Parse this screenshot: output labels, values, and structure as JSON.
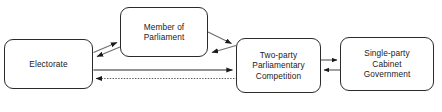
{
  "diagram": {
    "line_color": "#2b2b2b",
    "box_fill": "#ffffff",
    "nodes": [
      {
        "id": "electorate",
        "label": "Electorate"
      },
      {
        "id": "mp",
        "label": "Member of\nParliament"
      },
      {
        "id": "twoparty",
        "label": "Two-party\nParliamentary\nCompetition"
      },
      {
        "id": "singleparty",
        "label": "Single-party\nCabinet\nGovernment"
      }
    ],
    "edges": [
      {
        "id": "electorate-to-mp",
        "from": "electorate",
        "to": "mp",
        "style": "solid",
        "direction": "forward"
      },
      {
        "id": "mp-to-electorate",
        "from": "mp",
        "to": "electorate",
        "style": "solid",
        "direction": "forward"
      },
      {
        "id": "mp-to-twoparty",
        "from": "mp",
        "to": "twoparty",
        "style": "solid",
        "direction": "forward"
      },
      {
        "id": "twoparty-to-mp",
        "from": "twoparty",
        "to": "mp",
        "style": "solid",
        "direction": "forward"
      },
      {
        "id": "electorate-to-twoparty",
        "from": "electorate",
        "to": "twoparty",
        "style": "solid",
        "direction": "forward"
      },
      {
        "id": "twoparty-to-electorate",
        "from": "twoparty",
        "to": "electorate",
        "style": "dotted",
        "direction": "forward"
      },
      {
        "id": "twoparty-to-singleparty",
        "from": "twoparty",
        "to": "singleparty",
        "style": "solid",
        "direction": "forward"
      },
      {
        "id": "singleparty-to-twoparty",
        "from": "singleparty",
        "to": "twoparty",
        "style": "solid",
        "direction": "forward"
      }
    ]
  }
}
